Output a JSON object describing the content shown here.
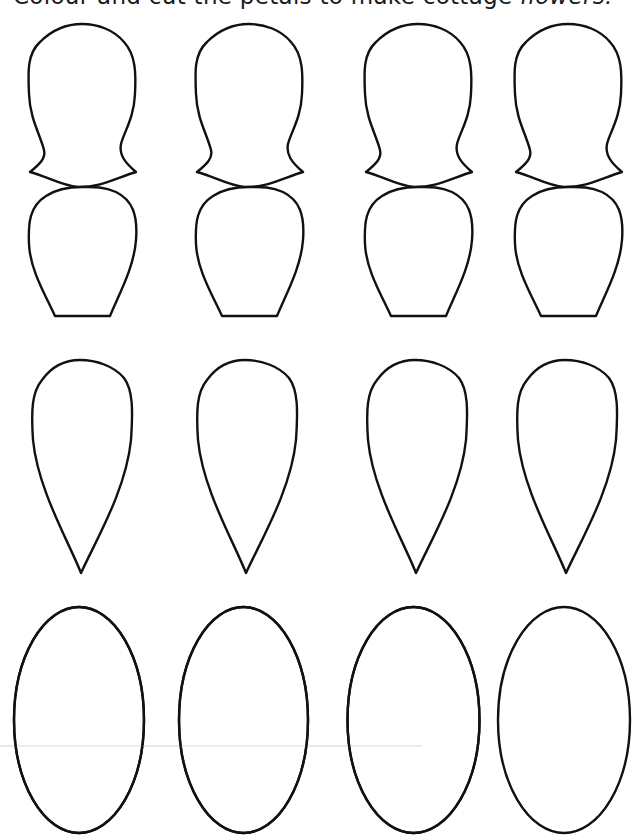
{
  "worksheet": {
    "title_main": "Colour and cut the petals to make cottage ",
    "title_emph": "flowers.",
    "instructions": "Colour and cut the petals to make cottage flowers."
  },
  "colors": {
    "outline": "#111111",
    "paper": "#ffffff",
    "crease": "#e6e6e6"
  },
  "petal_rows": [
    {
      "shape": "notched-petal",
      "count": 4,
      "columns_x": [
        28,
        195,
        364,
        514
      ]
    },
    {
      "shape": "rounded-flat-bottom-petal",
      "count": 4,
      "columns_x": [
        28,
        195,
        364,
        514
      ]
    },
    {
      "shape": "teardrop-petal",
      "count": 4,
      "columns_x": [
        32,
        197,
        367,
        517
      ]
    },
    {
      "shape": "oval-petal",
      "count": 4,
      "centers_x": [
        79,
        243,
        413,
        564
      ]
    }
  ]
}
